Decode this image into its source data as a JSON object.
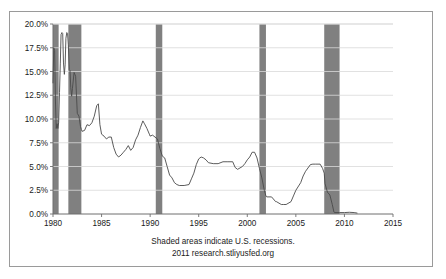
{
  "figure": {
    "border_color": "#9a9a9a",
    "background": "#ffffff"
  },
  "caption": {
    "line1": "Shaded areas indicate U.S. recessions.",
    "line2": "2011 research.stliyusfed.org"
  },
  "chart_data": {
    "type": "line",
    "title": "",
    "xlabel": "",
    "ylabel": "",
    "xlim": [
      1980,
      2015
    ],
    "ylim": [
      0,
      20
    ],
    "grid": true,
    "legend": false,
    "line_color": "#4a4a4a",
    "grid_color": "#d9d9d9",
    "axis_color": "#6e6e6e",
    "shade_color": "#808080",
    "xticks": [
      1980,
      1985,
      1990,
      1995,
      2000,
      2005,
      2010,
      2015
    ],
    "xtick_labels": [
      "1980",
      "1985",
      "1990",
      "1995",
      "2000",
      "2005",
      "2010",
      "2015"
    ],
    "yticks": [
      0,
      2.5,
      5,
      7.5,
      10,
      12.5,
      15,
      17.5,
      20
    ],
    "ytick_labels": [
      "0.0%",
      "2.5%",
      "5.0%",
      "7.5%",
      "10.0%",
      "12.5%",
      "15.0%",
      "17.5%",
      "20.0%"
    ],
    "recessions": [
      {
        "start": 1980.0,
        "end": 1980.58
      },
      {
        "start": 1981.58,
        "end": 1982.92
      },
      {
        "start": 1990.58,
        "end": 1991.25
      },
      {
        "start": 2001.25,
        "end": 2001.92
      },
      {
        "start": 2007.92,
        "end": 2009.5
      }
    ],
    "series": [
      {
        "name": "Effective Federal Funds Rate",
        "x": [
          1980.0,
          1980.08,
          1980.17,
          1980.25,
          1980.33,
          1980.42,
          1980.5,
          1980.58,
          1980.67,
          1980.75,
          1980.83,
          1980.92,
          1981.0,
          1981.08,
          1981.17,
          1981.25,
          1981.33,
          1981.42,
          1981.5,
          1981.58,
          1981.67,
          1981.75,
          1981.83,
          1981.92,
          1982.0,
          1982.17,
          1982.33,
          1982.5,
          1982.67,
          1982.83,
          1982.92,
          1983.0,
          1983.25,
          1983.5,
          1983.75,
          1984.0,
          1984.25,
          1984.5,
          1984.67,
          1984.83,
          1985.0,
          1985.25,
          1985.5,
          1985.75,
          1986.0,
          1986.25,
          1986.5,
          1986.75,
          1987.0,
          1987.25,
          1987.5,
          1987.75,
          1988.0,
          1988.25,
          1988.5,
          1988.75,
          1989.0,
          1989.25,
          1989.42,
          1989.67,
          1989.92,
          1990.0,
          1990.25,
          1990.5,
          1990.75,
          1991.0,
          1991.25,
          1991.5,
          1991.75,
          1992.0,
          1992.25,
          1992.5,
          1992.75,
          1993.0,
          1993.5,
          1994.0,
          1994.25,
          1994.5,
          1994.75,
          1995.0,
          1995.25,
          1995.5,
          1995.75,
          1996.0,
          1996.5,
          1997.0,
          1997.5,
          1998.0,
          1998.5,
          1998.75,
          1999.0,
          1999.5,
          1999.75,
          2000.0,
          2000.25,
          2000.5,
          2000.75,
          2001.0,
          2001.25,
          2001.5,
          2001.75,
          2001.92,
          2002.0,
          2002.5,
          2002.92,
          2003.0,
          2003.5,
          2003.75,
          2004.0,
          2004.5,
          2004.75,
          2005.0,
          2005.5,
          2005.75,
          2006.0,
          2006.5,
          2006.75,
          2007.0,
          2007.5,
          2007.75,
          2007.92,
          2008.0,
          2008.25,
          2008.5,
          2008.75,
          2008.92,
          2009.0,
          2009.5,
          2010.0,
          2010.5,
          2011.0,
          2011.3
        ],
        "values": [
          13.8,
          17.5,
          17.2,
          12.0,
          9.0,
          9.5,
          9.0,
          9.6,
          12.8,
          15.8,
          18.9,
          19.1,
          19.0,
          15.9,
          14.7,
          15.7,
          18.5,
          19.1,
          19.0,
          17.8,
          15.2,
          15.1,
          13.3,
          12.4,
          13.2,
          14.9,
          14.5,
          10.6,
          10.3,
          9.2,
          8.9,
          8.7,
          8.8,
          9.4,
          9.3,
          9.6,
          10.3,
          11.4,
          11.6,
          9.4,
          8.4,
          8.2,
          7.9,
          8.1,
          8.1,
          7.0,
          6.3,
          6.0,
          6.2,
          6.5,
          6.8,
          7.2,
          6.7,
          7.0,
          7.8,
          8.3,
          9.1,
          9.8,
          9.5,
          9.0,
          8.4,
          8.2,
          8.3,
          8.1,
          7.9,
          6.9,
          6.1,
          5.9,
          5.0,
          4.1,
          3.8,
          3.3,
          3.1,
          3.0,
          3.0,
          3.1,
          3.7,
          4.3,
          5.2,
          5.8,
          6.0,
          5.9,
          5.7,
          5.4,
          5.3,
          5.3,
          5.5,
          5.5,
          5.5,
          4.9,
          4.7,
          5.0,
          5.3,
          5.7,
          6.0,
          6.5,
          6.5,
          5.9,
          4.8,
          3.8,
          2.5,
          1.9,
          1.8,
          1.8,
          1.3,
          1.3,
          1.0,
          1.0,
          1.0,
          1.3,
          1.9,
          2.5,
          3.3,
          4.0,
          4.5,
          5.2,
          5.25,
          5.25,
          5.25,
          4.8,
          4.3,
          3.2,
          2.3,
          2.0,
          1.0,
          0.2,
          0.15,
          0.15,
          0.15,
          0.18,
          0.15,
          0.1
        ]
      }
    ]
  }
}
